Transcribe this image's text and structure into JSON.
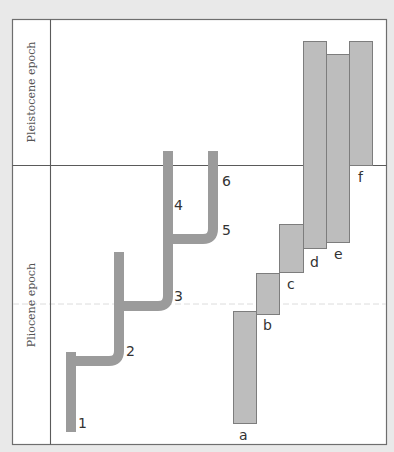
{
  "diagram": {
    "epochs": [
      {
        "id": "pleistocene",
        "label": "Pleistocene epoch"
      },
      {
        "id": "pliocene",
        "label": "Pliocene epoch"
      }
    ],
    "lineage_labels": [
      "1",
      "2",
      "3",
      "4",
      "5",
      "6"
    ],
    "range_bar_labels": [
      "a",
      "b",
      "c",
      "d",
      "e",
      "f"
    ],
    "colors": {
      "background": "#e9e9e9",
      "panel": "#ffffff",
      "frame": "#6e6e6e",
      "branch": "#9b9b9b",
      "bar_fill": "#bdbdbd",
      "bar_stroke": "#7d7d7d"
    }
  }
}
